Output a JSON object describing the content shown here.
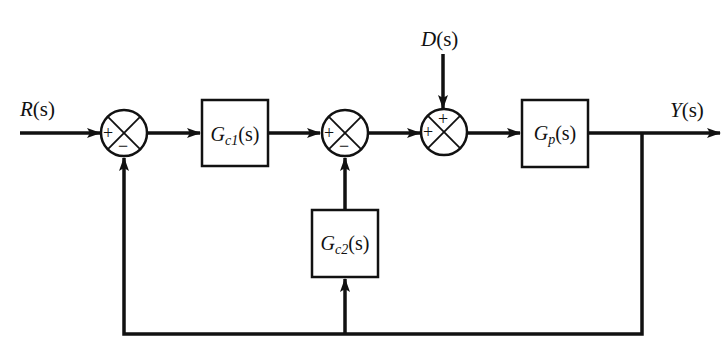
{
  "diagram": {
    "type": "block-diagram",
    "colors": {
      "stroke": "#111111",
      "background": "#ffffff"
    },
    "signals": {
      "input": {
        "label": "R(s)",
        "main": "R",
        "arg": "(s)"
      },
      "disturbance": {
        "label": "D(s)",
        "main": "D",
        "arg": "(s)"
      },
      "output": {
        "label": "Y(s)",
        "main": "Y",
        "arg": "(s)"
      }
    },
    "blocks": [
      {
        "id": "gc1",
        "label": "Gc1(s)",
        "main": "G",
        "sub": "c1",
        "arg": "(s)"
      },
      {
        "id": "gc2",
        "label": "Gc2(s)",
        "main": "G",
        "sub": "c2",
        "arg": "(s)"
      },
      {
        "id": "gp",
        "label": "Gp(s)",
        "main": "G",
        "sub": "p",
        "arg": "(s)"
      }
    ],
    "summing_junctions": [
      {
        "id": "sum1",
        "signs": {
          "left": "+",
          "bottom": "−"
        }
      },
      {
        "id": "sum2",
        "signs": {
          "left": "+",
          "bottom": "−"
        }
      },
      {
        "id": "sum3",
        "signs": {
          "left": "+",
          "top": "+"
        }
      }
    ]
  }
}
